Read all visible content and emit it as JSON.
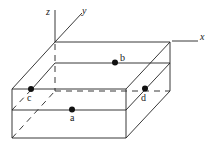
{
  "diagram": {
    "axes": [
      {
        "id": "x",
        "label": "x"
      },
      {
        "id": "y",
        "label": "y"
      },
      {
        "id": "z",
        "label": "z"
      }
    ],
    "points": [
      {
        "id": "a",
        "label": "a",
        "location": "front face, mid-level line"
      },
      {
        "id": "b",
        "label": "b",
        "location": "back face, mid-level line"
      },
      {
        "id": "c",
        "label": "c",
        "location": "front-left corner, top edge"
      },
      {
        "id": "d",
        "label": "d",
        "location": "right face, at dashed back level"
      }
    ],
    "colors": {
      "line": "#222222",
      "point": "#111111",
      "background": "#ffffff"
    }
  }
}
